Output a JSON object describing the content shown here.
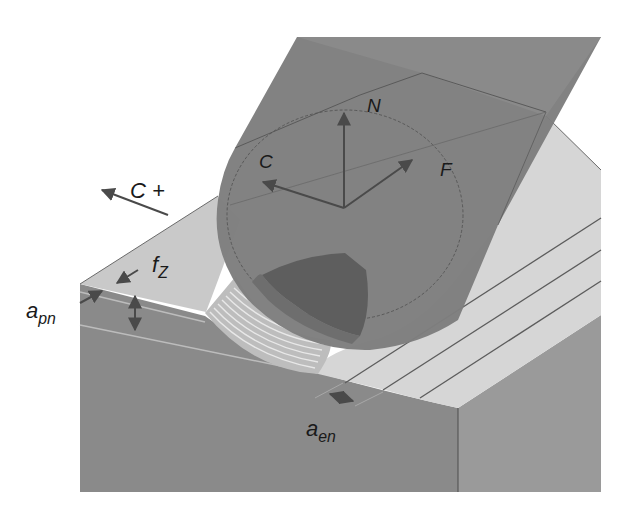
{
  "figure": {
    "colors": {
      "background": "#ffffff",
      "workpiece_front": "#8a8a8a",
      "workpiece_right": "#9a9a9a",
      "workpiece_top_left": "#c9c9c9",
      "machined_slots": "#d6d6d6",
      "tool_body": "#7e7e7e",
      "tool_shadow_cap": "#5e5e5e",
      "arrow": "#4a4a4a",
      "label_text": "#1a1a1a"
    }
  },
  "labels": {
    "cutting_dir": {
      "main": "C",
      "suffix": " +"
    },
    "frame_c": "C",
    "frame_n": "N",
    "frame_f": "F",
    "feed_per_tooth": {
      "main": "f",
      "sub": "Z"
    },
    "axial_depth": {
      "main": "a",
      "sub": "pn"
    },
    "radial_depth": {
      "main": "a",
      "sub": "en"
    }
  }
}
